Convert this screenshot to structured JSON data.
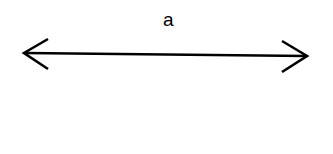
{
  "diagram": {
    "type": "double-headed-arrow",
    "label": "a",
    "stroke_color": "#000000",
    "background": "#ffffff",
    "arrow": {
      "start": [
        24,
        53
      ],
      "end": [
        307,
        56
      ],
      "left_head": [
        [
          48,
          39
        ],
        [
          24,
          53
        ],
        [
          48,
          69
        ]
      ],
      "right_head": [
        [
          282,
          41
        ],
        [
          307,
          56
        ],
        [
          282,
          72
        ]
      ]
    }
  }
}
